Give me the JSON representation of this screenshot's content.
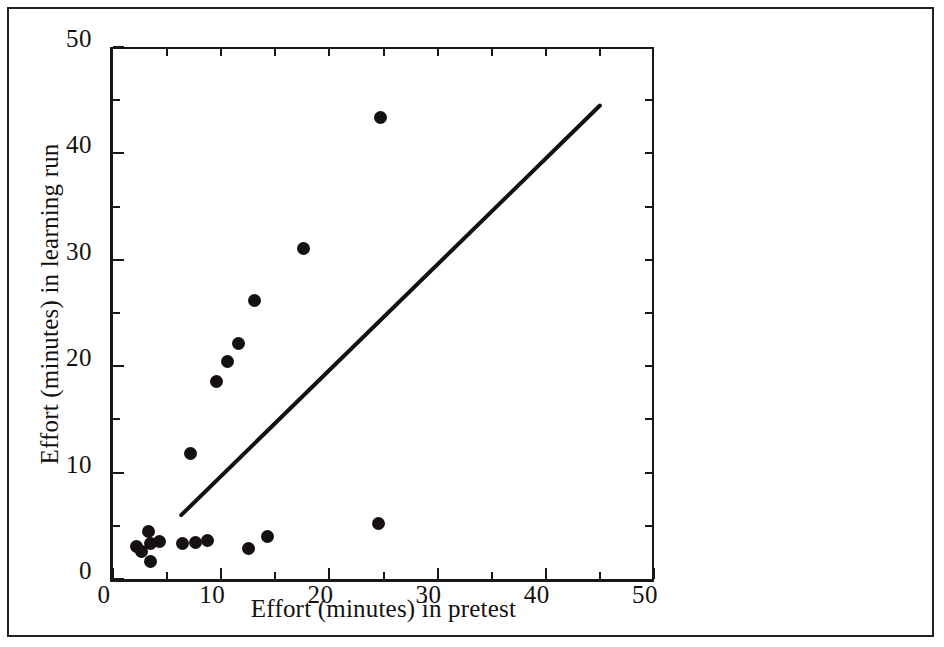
{
  "figure": {
    "background_color": "#ffffff",
    "ink_color": "#141110",
    "border_color": "#23201e"
  },
  "chart_data": {
    "type": "scatter",
    "title": "",
    "xlabel": "Effort (minutes) in pretest",
    "ylabel": "Effort (minutes) in learning run",
    "xlim": [
      0,
      50
    ],
    "ylim": [
      0,
      50
    ],
    "grid": false,
    "legend": null,
    "x_major_ticks": [
      0,
      10,
      20,
      30,
      40,
      50
    ],
    "y_major_ticks": [
      0,
      10,
      20,
      30,
      40,
      50
    ],
    "x_minor_ticks": [
      5,
      15,
      25,
      35,
      45
    ],
    "y_minor_ticks": [
      5,
      15,
      25,
      35,
      45
    ],
    "x_tick_labels": [
      "0",
      "10",
      "20",
      "30",
      "40",
      "50"
    ],
    "y_tick_labels": [
      "0",
      "10",
      "20",
      "30",
      "40",
      "50"
    ],
    "marker": "filled-circle",
    "marker_color": "#141110",
    "points": [
      {
        "x": 2.2,
        "y": 3.1
      },
      {
        "x": 2.6,
        "y": 2.6
      },
      {
        "x": 3.3,
        "y": 4.5
      },
      {
        "x": 3.5,
        "y": 3.3
      },
      {
        "x": 3.5,
        "y": 1.6
      },
      {
        "x": 4.3,
        "y": 3.5
      },
      {
        "x": 6.4,
        "y": 3.3
      },
      {
        "x": 7.2,
        "y": 11.8
      },
      {
        "x": 7.6,
        "y": 3.4
      },
      {
        "x": 8.7,
        "y": 3.6
      },
      {
        "x": 9.6,
        "y": 18.6
      },
      {
        "x": 10.6,
        "y": 20.4
      },
      {
        "x": 11.6,
        "y": 22.1
      },
      {
        "x": 12.5,
        "y": 2.9
      },
      {
        "x": 13.1,
        "y": 26.2
      },
      {
        "x": 14.3,
        "y": 4.0
      },
      {
        "x": 17.6,
        "y": 31.1
      },
      {
        "x": 24.5,
        "y": 5.2
      },
      {
        "x": 24.7,
        "y": 43.4
      }
    ],
    "line": {
      "name": "fitted line",
      "color": "#141110",
      "width_px": 4,
      "x_start": 6.3,
      "y_start": 6.0,
      "x_end": 45.0,
      "y_end": 44.5
    }
  }
}
